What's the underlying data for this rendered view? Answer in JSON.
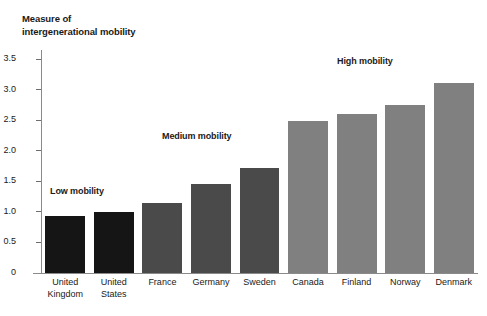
{
  "chart_data": {
    "type": "bar",
    "title": "Measure of\nintergenerational mobility",
    "xlabel": "",
    "ylabel": "Measure of intergenerational mobility",
    "categories": [
      "United\nKingdom",
      "United\nStates",
      "France",
      "Germany",
      "Sweden",
      "Canada",
      "Finland",
      "Norway",
      "Denmark"
    ],
    "values": [
      0.93,
      1.0,
      1.15,
      1.45,
      1.72,
      2.48,
      2.6,
      2.75,
      3.11
    ],
    "ylim": [
      0,
      3.65
    ],
    "yticks": [
      "0",
      "0.5",
      "1.0",
      "1.5",
      "2.0",
      "2.5",
      "3.0",
      "3.5"
    ],
    "ytick_values": [
      0,
      0.5,
      1.0,
      1.5,
      2.0,
      2.5,
      3.0,
      3.5
    ],
    "grid": false,
    "legend_position": "none",
    "bar_colors": [
      "#151515",
      "#151515",
      "#4a4a4a",
      "#4a4a4a",
      "#4a4a4a",
      "#808080",
      "#808080",
      "#808080",
      "#808080"
    ],
    "groups": [
      {
        "name": "Low mobility",
        "color": "#151515",
        "members": [
          "United Kingdom",
          "United States"
        ]
      },
      {
        "name": "Medium mobility",
        "color": "#4a4a4a",
        "members": [
          "France",
          "Germany",
          "Sweden"
        ]
      },
      {
        "name": "High mobility",
        "color": "#808080",
        "members": [
          "Canada",
          "Finland",
          "Norway",
          "Denmark"
        ]
      }
    ],
    "annotations": [
      {
        "text": "Low mobility",
        "x_px": 50,
        "y_px": 186
      },
      {
        "text": "Medium mobility",
        "x_px": 162,
        "y_px": 131
      },
      {
        "text": "High mobility",
        "x_px": 337,
        "y_px": 56
      }
    ]
  },
  "colors": {
    "background": "#ffffff",
    "axis": "#8a8a8a",
    "text": "#1a1a1a",
    "dark": "#151515",
    "mid": "#4a4a4a",
    "light": "#808080"
  }
}
